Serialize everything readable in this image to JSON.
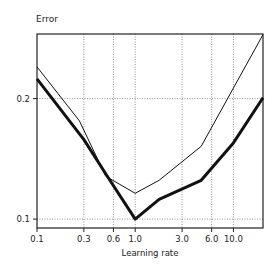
{
  "chart_data": {
    "type": "line",
    "title": "",
    "xlabel": "Learning rate",
    "ylabel": "Error",
    "xscale": "log",
    "yscale": "log",
    "xlim": [
      0.1,
      20
    ],
    "ylim": [
      0.095,
      0.29
    ],
    "grid": true,
    "grid_style": "dotted",
    "legend": null,
    "x_ticks": [
      0.1,
      0.3,
      0.6,
      1.0,
      3.0,
      6.0,
      10.0
    ],
    "x_tick_labels": [
      "0.1",
      "0.3",
      "0.6",
      "1.0",
      "3.0",
      "6.0",
      "10.0"
    ],
    "y_ticks": [
      0.1,
      0.2
    ],
    "y_tick_labels": [
      "0.1",
      "0.2"
    ],
    "series": [
      {
        "name": "thin-line",
        "style": "thin",
        "x": [
          0.1,
          0.27,
          0.5,
          1.0,
          1.75,
          4.7,
          20
        ],
        "y": [
          0.24,
          0.176,
          0.128,
          0.116,
          0.125,
          0.152,
          0.289
        ]
      },
      {
        "name": "thick-line",
        "style": "thick",
        "x": [
          0.1,
          0.3,
          0.52,
          1.0,
          1.75,
          4.7,
          10.0,
          20
        ],
        "y": [
          0.224,
          0.158,
          0.128,
          0.1,
          0.112,
          0.125,
          0.155,
          0.201
        ]
      }
    ]
  }
}
